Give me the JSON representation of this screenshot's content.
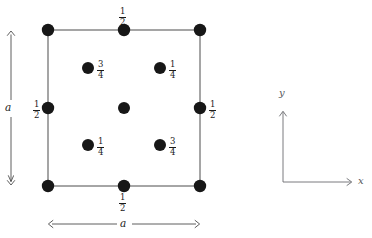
{
  "figure": {
    "kind": "crystal-unit-cell-projection",
    "title_fragment": "",
    "cell": {
      "left": 48,
      "top": 30,
      "right": 200,
      "bottom": 186,
      "edge_color": "#4d4d4d",
      "edge_width": 1.0
    },
    "dot": {
      "color": "#171717",
      "radius_corner": 6.2,
      "radius_edge": 6.2,
      "radius_interior": 6.0,
      "radius_center": 6.0
    },
    "lattice_points": [
      {
        "name": "corner-top-left",
        "x": 48,
        "y": 30,
        "label": null,
        "label_pos": "none"
      },
      {
        "name": "corner-top-right",
        "x": 200,
        "y": 30,
        "label": null,
        "label_pos": "none"
      },
      {
        "name": "corner-bottom-left",
        "x": 48,
        "y": 186,
        "label": null,
        "label_pos": "none"
      },
      {
        "name": "corner-bottom-right",
        "x": 200,
        "y": 186,
        "label": null,
        "label_pos": "none"
      },
      {
        "name": "edge-mid-top",
        "x": 124,
        "y": 30,
        "label": "1/2",
        "label_pos": "above"
      },
      {
        "name": "edge-mid-bottom",
        "x": 124,
        "y": 186,
        "label": "1/2",
        "label_pos": "below"
      },
      {
        "name": "edge-mid-left",
        "x": 48,
        "y": 108,
        "label": "1/2",
        "label_pos": "left"
      },
      {
        "name": "edge-mid-right",
        "x": 200,
        "y": 108,
        "label": "1/2",
        "label_pos": "right"
      },
      {
        "name": "center",
        "x": 124,
        "y": 108,
        "label": null,
        "label_pos": "none"
      },
      {
        "name": "interior-upper-left",
        "x": 88,
        "y": 68,
        "label": "3/4",
        "label_pos": "right"
      },
      {
        "name": "interior-upper-right",
        "x": 160,
        "y": 68,
        "label": "1/4",
        "label_pos": "right"
      },
      {
        "name": "interior-lower-left",
        "x": 88,
        "y": 145,
        "label": "1/4",
        "label_pos": "right"
      },
      {
        "name": "interior-lower-right",
        "x": 160,
        "y": 145,
        "label": "3/4",
        "label_pos": "right"
      }
    ],
    "fractions": {
      "one_half": {
        "numerator": "1",
        "denominator": "2"
      },
      "one_quarter": {
        "numerator": "1",
        "denominator": "4"
      },
      "three_quarters": {
        "numerator": "3",
        "denominator": "4"
      }
    },
    "dimensions": {
      "vertical": {
        "label": "a",
        "x": 11,
        "y_top": 30,
        "y_bottom": 186,
        "label_x": 5,
        "label_y": 108
      },
      "horizontal": {
        "label": "a",
        "y": 224,
        "x_left": 48,
        "x_right": 200,
        "label_x": 124,
        "label_y": 224
      },
      "arrow_color": "#4d4d4d"
    },
    "axes_legend": {
      "origin_x": 283,
      "origin_y": 182,
      "x_end": 355,
      "y_end": 108,
      "x_label": "x",
      "y_label": "y",
      "color": "#6b6c70"
    }
  }
}
